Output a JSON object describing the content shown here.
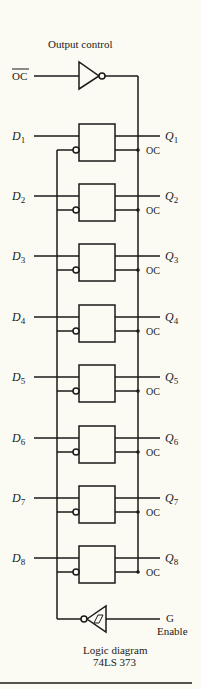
{
  "title": "Output control",
  "oc_input": "OC",
  "caption": {
    "line1": "Logic diagram",
    "line2": "74LS 373"
  },
  "enable": {
    "pin": "G",
    "label": "Enable"
  },
  "latches": [
    {
      "d": "D",
      "q": "Q",
      "n": "1",
      "oc": "OC"
    },
    {
      "d": "D",
      "q": "Q",
      "n": "2",
      "oc": "OC"
    },
    {
      "d": "D",
      "q": "Q",
      "n": "3",
      "oc": "OC"
    },
    {
      "d": "D",
      "q": "Q",
      "n": "4",
      "oc": "OC"
    },
    {
      "d": "D",
      "q": "Q",
      "n": "5",
      "oc": "OC"
    },
    {
      "d": "D",
      "q": "Q",
      "n": "6",
      "oc": "OC"
    },
    {
      "d": "D",
      "q": "Q",
      "n": "7",
      "oc": "OC"
    },
    {
      "d": "D",
      "q": "Q",
      "n": "8",
      "oc": "OC"
    }
  ]
}
